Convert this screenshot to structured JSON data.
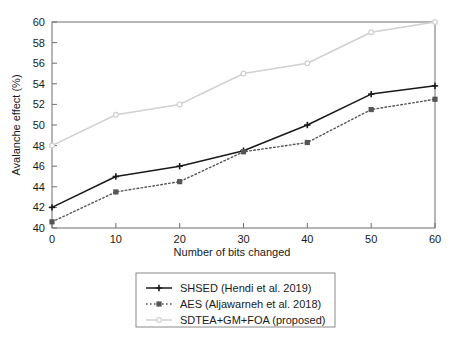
{
  "chart_data": {
    "type": "line",
    "title": "",
    "xlabel": "Number of bits changed",
    "ylabel": "Avalanche effect (%)",
    "x": [
      0,
      10,
      20,
      30,
      40,
      50,
      60
    ],
    "xlim": [
      0,
      60
    ],
    "ylim": [
      40,
      60
    ],
    "xticks": [
      "0",
      "10",
      "20",
      "30",
      "40",
      "50",
      "60"
    ],
    "yticks": [
      "40",
      "42",
      "44",
      "46",
      "48",
      "50",
      "52",
      "54",
      "56",
      "58",
      "60"
    ],
    "grid": false,
    "legend_position": "below-plot-center",
    "series": [
      {
        "name": "SHSED (Hendi et al. 2019)",
        "values": [
          42.0,
          45.0,
          46.0,
          47.5,
          50.0,
          53.0,
          53.8
        ],
        "color": "#1a1a1a",
        "style": "solid",
        "marker": "plus"
      },
      {
        "name": "AES (Aljawarneh et al. 2018)",
        "values": [
          40.6,
          43.5,
          44.5,
          47.4,
          48.3,
          51.5,
          52.5
        ],
        "color": "#555555",
        "style": "dotted",
        "marker": "square"
      },
      {
        "name": "SDTEA+GM+FOA (proposed)",
        "values": [
          48.0,
          51.0,
          52.0,
          55.0,
          56.0,
          59.0,
          60.0
        ],
        "color": "#d0d0d0",
        "style": "solid",
        "marker": "circle"
      }
    ]
  },
  "axis": {
    "ylabel": "Avalanche effect (%)",
    "xlabel": "Number of bits changed",
    "yticks": [
      "60",
      "58",
      "56",
      "54",
      "52",
      "50",
      "48",
      "46",
      "44",
      "42",
      "40"
    ],
    "xticks": [
      "0",
      "10",
      "20",
      "30",
      "40",
      "50",
      "60"
    ]
  },
  "legend": {
    "entries": [
      {
        "label": "SHSED (Hendi et al. 2019)",
        "color": "#1a1a1a",
        "style": "solid",
        "marker": "plus"
      },
      {
        "label": "AES (Aljawarneh et al. 2018)",
        "color": "#555555",
        "style": "dotted",
        "marker": "square"
      },
      {
        "label": "SDTEA+GM+FOA (proposed)",
        "color": "#d0d0d0",
        "style": "solid",
        "marker": "circle"
      }
    ]
  },
  "colors": {
    "axis": "#6f6f6f",
    "text": "#1a1a1a",
    "series_1": "#1a1a1a",
    "series_2": "#555555",
    "series_3": "#d0d0d0",
    "legend_border": "#8a8a8a",
    "background": "#ffffff"
  }
}
